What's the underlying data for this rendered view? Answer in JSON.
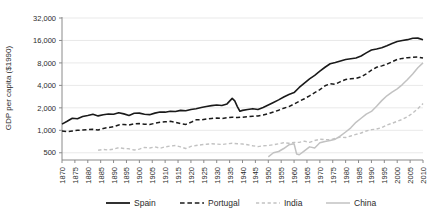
{
  "chart_data": {
    "type": "line",
    "title": "",
    "xlabel": "",
    "ylabel": "GDP per capita ($1990)",
    "yscale": "log",
    "ylim": [
      400,
      32000
    ],
    "xlim": [
      1870,
      2010
    ],
    "grid": true,
    "legend_position": "bottom",
    "ytick_labels": [
      "32,000",
      "16,000",
      "8,000",
      "4,000",
      "2,000",
      "1,000",
      "500"
    ],
    "ytick_values": [
      32000,
      16000,
      8000,
      4000,
      2000,
      1000,
      500
    ],
    "xtick_labels": [
      "1870",
      "1875",
      "1880",
      "1885",
      "1890",
      "1895",
      "1900",
      "1905",
      "1910",
      "1915",
      "1920",
      "1925",
      "1930",
      "1935",
      "1940",
      "1945",
      "1950",
      "1955",
      "1960",
      "1965",
      "1970",
      "1975",
      "1980",
      "1985",
      "1990",
      "1995",
      "2000",
      "2005",
      "2010"
    ],
    "xtick_values": [
      1870,
      1875,
      1880,
      1885,
      1890,
      1895,
      1900,
      1905,
      1910,
      1915,
      1920,
      1925,
      1930,
      1935,
      1940,
      1945,
      1950,
      1955,
      1960,
      1965,
      1970,
      1975,
      1980,
      1985,
      1990,
      1995,
      2000,
      2005,
      2010
    ],
    "series": [
      {
        "name": "Spain",
        "color": "#1a1a1a",
        "style": "solid",
        "width": 1.6,
        "x": [
          1870,
          1872,
          1874,
          1876,
          1878,
          1880,
          1882,
          1884,
          1886,
          1888,
          1890,
          1892,
          1894,
          1896,
          1898,
          1900,
          1902,
          1904,
          1906,
          1908,
          1910,
          1912,
          1914,
          1916,
          1918,
          1920,
          1922,
          1924,
          1926,
          1928,
          1930,
          1932,
          1934,
          1936,
          1937,
          1938,
          1939,
          1940,
          1942,
          1944,
          1946,
          1948,
          1950,
          1952,
          1954,
          1956,
          1958,
          1960,
          1962,
          1964,
          1966,
          1968,
          1970,
          1972,
          1974,
          1976,
          1978,
          1980,
          1982,
          1984,
          1986,
          1988,
          1990,
          1992,
          1994,
          1996,
          1998,
          2000,
          2002,
          2004,
          2006,
          2008,
          2010
        ],
        "values": [
          1210,
          1320,
          1450,
          1430,
          1530,
          1580,
          1640,
          1560,
          1620,
          1650,
          1640,
          1720,
          1660,
          1580,
          1690,
          1700,
          1640,
          1620,
          1700,
          1760,
          1750,
          1800,
          1790,
          1850,
          1830,
          1900,
          1950,
          2020,
          2090,
          2140,
          2180,
          2150,
          2260,
          2680,
          2480,
          2080,
          1800,
          1850,
          1900,
          1950,
          1900,
          2020,
          2180,
          2360,
          2560,
          2800,
          3020,
          3200,
          3750,
          4300,
          4900,
          5450,
          6200,
          7000,
          7800,
          8100,
          8500,
          8900,
          9100,
          9300,
          9900,
          10900,
          11900,
          12300,
          12800,
          13600,
          14600,
          15500,
          16000,
          16400,
          17100,
          17200,
          16400
        ]
      },
      {
        "name": "Portugal",
        "color": "#1a1a1a",
        "style": "dashed",
        "width": 1.5,
        "x": [
          1870,
          1872,
          1874,
          1876,
          1878,
          1880,
          1882,
          1884,
          1886,
          1888,
          1890,
          1892,
          1894,
          1896,
          1898,
          1900,
          1902,
          1904,
          1906,
          1908,
          1910,
          1912,
          1914,
          1916,
          1918,
          1920,
          1922,
          1924,
          1926,
          1928,
          1930,
          1932,
          1934,
          1936,
          1938,
          1940,
          1942,
          1944,
          1946,
          1948,
          1950,
          1952,
          1954,
          1956,
          1958,
          1960,
          1962,
          1964,
          1966,
          1968,
          1970,
          1972,
          1974,
          1976,
          1978,
          1980,
          1982,
          1984,
          1986,
          1988,
          1990,
          1992,
          1994,
          1996,
          1998,
          2000,
          2002,
          2004,
          2006,
          2008,
          2010
        ],
        "values": [
          980,
          960,
          980,
          1000,
          1010,
          1020,
          1030,
          1010,
          1060,
          1090,
          1120,
          1180,
          1200,
          1180,
          1220,
          1230,
          1210,
          1200,
          1240,
          1280,
          1300,
          1320,
          1280,
          1230,
          1200,
          1280,
          1380,
          1380,
          1420,
          1440,
          1460,
          1440,
          1480,
          1500,
          1480,
          1500,
          1520,
          1540,
          1560,
          1600,
          1670,
          1760,
          1860,
          1980,
          2080,
          2250,
          2450,
          2650,
          2900,
          3200,
          3500,
          3950,
          4200,
          4150,
          4500,
          4800,
          4900,
          4950,
          5200,
          5700,
          6400,
          7000,
          7300,
          7700,
          8300,
          8900,
          9200,
          9400,
          9500,
          9600,
          9300
        ]
      },
      {
        "name": "India",
        "color": "#c2c2c2",
        "style": "dashed",
        "width": 1.4,
        "x": [
          1884,
          1886,
          1888,
          1890,
          1892,
          1894,
          1896,
          1898,
          1900,
          1902,
          1904,
          1906,
          1908,
          1910,
          1912,
          1914,
          1916,
          1918,
          1920,
          1922,
          1924,
          1926,
          1928,
          1930,
          1932,
          1934,
          1936,
          1938,
          1940,
          1942,
          1944,
          1946,
          1948,
          1950,
          1952,
          1954,
          1956,
          1958,
          1960,
          1962,
          1964,
          1966,
          1968,
          1970,
          1972,
          1974,
          1976,
          1978,
          1980,
          1982,
          1984,
          1986,
          1988,
          1990,
          1992,
          1994,
          1996,
          1998,
          2000,
          2002,
          2004,
          2006,
          2008,
          2010
        ],
        "values": [
          540,
          555,
          545,
          560,
          585,
          570,
          565,
          545,
          560,
          590,
          580,
          600,
          575,
          600,
          615,
          625,
          600,
          570,
          610,
          625,
          640,
          650,
          660,
          655,
          645,
          660,
          670,
          660,
          655,
          640,
          620,
          605,
          620,
          625,
          640,
          660,
          680,
          670,
          690,
          690,
          715,
          690,
          730,
          760,
          750,
          745,
          780,
          810,
          800,
          840,
          880,
          920,
          980,
          1020,
          1040,
          1090,
          1180,
          1240,
          1320,
          1400,
          1520,
          1700,
          1950,
          2280
        ]
      },
      {
        "name": "China",
        "color": "#c2c2c2",
        "style": "solid",
        "width": 1.5,
        "x": [
          1950,
          1952,
          1954,
          1956,
          1958,
          1960,
          1961,
          1962,
          1964,
          1966,
          1968,
          1970,
          1972,
          1974,
          1976,
          1978,
          1980,
          1982,
          1984,
          1986,
          1988,
          1990,
          1992,
          1994,
          1996,
          1998,
          2000,
          2002,
          2004,
          2006,
          2008,
          2010
        ],
        "values": [
          440,
          500,
          520,
          570,
          640,
          660,
          480,
          470,
          530,
          600,
          580,
          680,
          710,
          730,
          760,
          840,
          950,
          1080,
          1280,
          1450,
          1650,
          1790,
          2100,
          2500,
          2900,
          3250,
          3600,
          4100,
          4800,
          5700,
          6900,
          8000
        ]
      }
    ]
  },
  "legend": {
    "items": [
      {
        "label": "Spain",
        "color": "#1a1a1a",
        "style": "solid"
      },
      {
        "label": "Portugal",
        "color": "#1a1a1a",
        "style": "dashed"
      },
      {
        "label": "India",
        "color": "#c2c2c2",
        "style": "dashed"
      },
      {
        "label": "China",
        "color": "#c2c2c2",
        "style": "solid"
      }
    ]
  }
}
